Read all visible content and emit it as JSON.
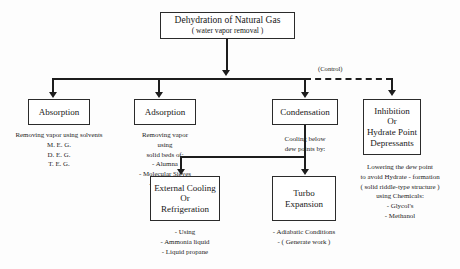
{
  "diagram": {
    "root": {
      "title": "Dehydration of Natural Gas",
      "subtitle": "( water vapor removal )"
    },
    "control_label": "(Control)",
    "branches": [
      {
        "id": "absorption",
        "box_lines": [
          "Absorption"
        ],
        "caption_lines": [
          "Removing vapor using solvents",
          "M. E. G.",
          "D. E. G.",
          "T. E. G."
        ]
      },
      {
        "id": "adsorption",
        "box_lines": [
          "Adsorption"
        ],
        "caption_lines": [
          "Removing vapor",
          "using",
          "solid beds of:",
          "- Alumna",
          "- Molecular Sieves",
          "- Silica Gel",
          "- CaCl₂"
        ]
      },
      {
        "id": "condensation",
        "box_lines": [
          "Condensation"
        ],
        "caption_lines": [
          "Cooling below",
          "dew points by:"
        ]
      },
      {
        "id": "inhibition",
        "box_lines": [
          "Inhibition",
          "Or",
          "Hydrate Point",
          "Depressants"
        ],
        "caption_lines": [
          "Lowering the dew point",
          "to avoid Hydrate - formation",
          "( solid riddle-type structure )",
          "using Chemicals:",
          "- Glycol's",
          "- Methanol"
        ]
      }
    ],
    "sub_branches": [
      {
        "id": "external-cooling",
        "box_lines": [
          "External Cooling",
          "Or",
          "Refrigeration"
        ],
        "caption_lines": [
          "- Using",
          "- Ammonia liquid",
          "- Liquid propane"
        ]
      },
      {
        "id": "turbo-expansion",
        "box_lines": [
          "Turbo",
          "Expansion"
        ],
        "caption_lines": [
          "- Adiabatic Conditions",
          "- ( Generate work )"
        ]
      }
    ],
    "colors": {
      "line": "#1d1d1d",
      "box_border": "#2b2b2b",
      "text": "#171717",
      "background": "#fdfdfd"
    }
  }
}
